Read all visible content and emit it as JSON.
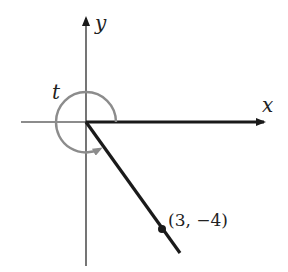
{
  "diagram": {
    "type": "angle-in-standard-position",
    "axes": {
      "x_label": "x",
      "y_label": "y"
    },
    "angle": {
      "label": "t",
      "direction": "counterclockwise",
      "arc_color": "#8c8c8c"
    },
    "point": {
      "label": "(3, −4)",
      "x": 3,
      "y": -4
    },
    "colors": {
      "axis": "#1a1a1a",
      "ray": "#1a1a1a",
      "arc": "#8c8c8c",
      "point": "#1a1a1a"
    }
  }
}
